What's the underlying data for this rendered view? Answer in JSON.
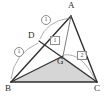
{
  "figure": {
    "canvas": {
      "width": 108,
      "height": 100
    },
    "colors": {
      "stroke": "#2f2f2f",
      "thin_stroke": "#6e6e6e",
      "arc_stroke": "#9a9a9a",
      "shade_fill": "#d6d6d6",
      "label_color": "#2a2a2a",
      "badge_color": "#555555",
      "background": "#ffffff"
    },
    "points": [
      {
        "name": "A",
        "label": "A",
        "x": 71,
        "y": 16,
        "label_x": 68,
        "label_y": 2
      },
      {
        "name": "B",
        "label": "B",
        "x": 11,
        "y": 82,
        "label_x": 6,
        "label_y": 84
      },
      {
        "name": "C",
        "label": "C",
        "x": 97,
        "y": 82,
        "label_x": 95,
        "label_y": 84
      },
      {
        "name": "D",
        "label": "D",
        "x": 39,
        "y": 41,
        "label_x": 29,
        "label_y": 32
      },
      {
        "name": "G",
        "label": "G",
        "x": 63,
        "y": 56,
        "label_x": 57,
        "label_y": 57
      }
    ],
    "segments": [
      {
        "name": "side-AB",
        "from": "A",
        "to": "B",
        "weight": "thick"
      },
      {
        "name": "side-BC",
        "from": "B",
        "to": "C",
        "weight": "thick"
      },
      {
        "name": "side-CA",
        "from": "C",
        "to": "A",
        "weight": "thick"
      },
      {
        "name": "cevian-B-to-A-through-D",
        "from": "B",
        "to": "A",
        "weight": "thick"
      },
      {
        "name": "cevian-D-to-C",
        "from": "D",
        "to": "C",
        "weight": "thick"
      },
      {
        "name": "cevian-B-to-G",
        "from": "B",
        "to": "G",
        "weight": "thick"
      },
      {
        "name": "cevian-G-to-C",
        "from": "G",
        "to": "C",
        "weight": "thick"
      },
      {
        "name": "cevian-A-to-G",
        "from": "A",
        "to": "G",
        "weight": "thin"
      }
    ],
    "shaded_region": {
      "name": "triangle-BGC",
      "vertices": [
        "B",
        "G",
        "C"
      ],
      "fill": "#d6d6d6"
    },
    "arcs": [
      {
        "name": "arc-D-to-A",
        "from_x": 40,
        "from_y": 39,
        "to_x": 69,
        "to_y": 18,
        "bulge": -13
      },
      {
        "name": "arc-B-to-D",
        "from_x": 11,
        "from_y": 79,
        "to_x": 38,
        "to_y": 43,
        "bulge": -12
      },
      {
        "name": "arc-G-to-C",
        "from_x": 63,
        "from_y": 55,
        "to_x": 95,
        "to_y": 80,
        "bulge": -9
      }
    ],
    "markers": [
      {
        "name": "marker-ratio-AD",
        "text": "1",
        "style": "circled",
        "x": 41,
        "y": 15
      },
      {
        "name": "marker-ratio-BD",
        "text": "1",
        "style": "circled",
        "x": 14,
        "y": 47
      },
      {
        "name": "marker-ratio-DG",
        "text": "1",
        "style": "boxed",
        "x": 50,
        "y": 36
      },
      {
        "name": "marker-ratio-GC",
        "text": "2",
        "style": "boxed",
        "x": 77,
        "y": 51
      }
    ]
  }
}
